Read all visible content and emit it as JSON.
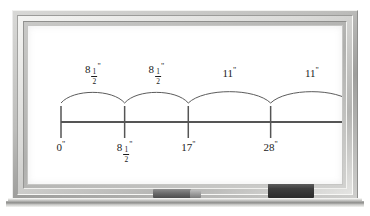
{
  "scene": {
    "type": "whiteboard-number-line-diagram",
    "board_background": "#ffffff",
    "ink_color": "#1b1b1b"
  },
  "objects": {
    "marker_name": "dry-erase-marker",
    "eraser_name": "whiteboard-eraser"
  },
  "chart_data": {
    "type": "line",
    "title": "",
    "xlabel": "",
    "ylabel": "",
    "axis": {
      "orientation": "horizontal",
      "start_value": 0,
      "end_value": 39,
      "unit": "inches",
      "unit_symbol": "\""
    },
    "ticks": [
      {
        "value": 0,
        "label_whole": "0",
        "label_num": "",
        "label_den": "",
        "label_inch": "\"",
        "has_fraction": false
      },
      {
        "value": 8.5,
        "label_whole": "8",
        "label_num": "1",
        "label_den": "2",
        "label_inch": "\"",
        "has_fraction": true
      },
      {
        "value": 17,
        "label_whole": "17",
        "label_num": "",
        "label_den": "",
        "label_inch": "\"",
        "has_fraction": false
      },
      {
        "value": 28,
        "label_whole": "28",
        "label_num": "",
        "label_den": "",
        "label_inch": "\"",
        "has_fraction": false
      },
      {
        "value": 39,
        "label_whole": "39",
        "label_num": "",
        "label_den": "",
        "label_inch": "\"",
        "has_fraction": false
      }
    ],
    "hops": [
      {
        "from": 0,
        "to": 8.5,
        "label_whole": "8",
        "label_num": "1",
        "label_den": "2",
        "label_inch": "\"",
        "has_fraction": true,
        "amount": 8.5
      },
      {
        "from": 8.5,
        "to": 17,
        "label_whole": "8",
        "label_num": "1",
        "label_den": "2",
        "label_inch": "\"",
        "has_fraction": true,
        "amount": 8.5
      },
      {
        "from": 17,
        "to": 28,
        "label_whole": "11",
        "label_num": "",
        "label_den": "",
        "label_inch": "\"",
        "has_fraction": false,
        "amount": 11
      },
      {
        "from": 28,
        "to": 39,
        "label_whole": "11",
        "label_num": "",
        "label_den": "",
        "label_inch": "\"",
        "has_fraction": false,
        "amount": 11
      }
    ],
    "grid": false,
    "legend": null,
    "arrow_at_end": true
  }
}
